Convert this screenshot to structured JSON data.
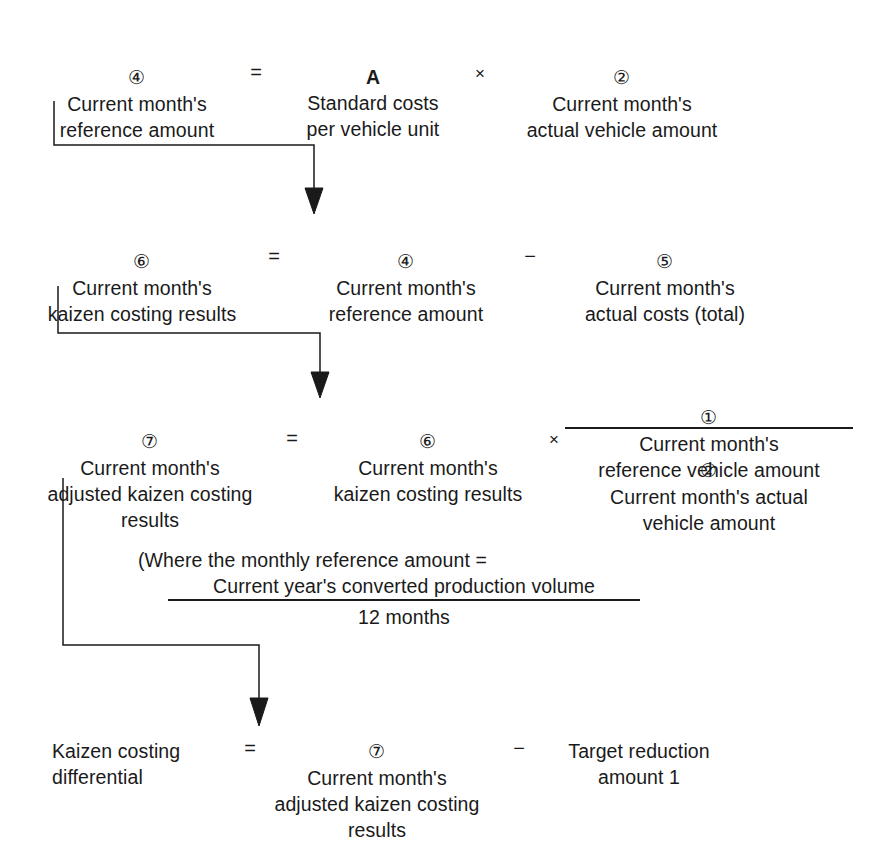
{
  "diagram": {
    "background": "#ffffff",
    "ink": "#1a1a1a",
    "rows": [
      {
        "id": "row1",
        "lhs_marker": "④",
        "lhs_text": "Current month's\nreference amount",
        "operator1": "=",
        "term1_marker": "A",
        "term1_text": "Standard costs\nper vehicle unit",
        "operator2": "×",
        "term2_marker": "②",
        "term2_text": "Current month's\nactual vehicle amount"
      },
      {
        "id": "row2",
        "lhs_marker": "⑥",
        "lhs_text": "Current month's\nkaizen costing results",
        "operator1": "=",
        "term1_marker": "④",
        "term1_text": "Current month's\nreference amount",
        "operator2": "−",
        "term2_marker": "⑤",
        "term2_text": "Current month's\nactual costs (total)"
      },
      {
        "id": "row3",
        "lhs_marker": "⑦",
        "lhs_text": "Current month's\nadjusted kaizen costing\nresults",
        "operator1": "=",
        "term1_marker": "⑥",
        "term1_text": "Current month's\nkaizen costing results",
        "operator2": "×",
        "fraction": {
          "numerator_marker": "①",
          "numerator_text": "Current month's\nreference vehicle amount",
          "denominator_marker": "②",
          "denominator_text": "Current month's actual\nvehicle amount"
        }
      },
      {
        "id": "row4",
        "lhs_marker": "",
        "lhs_text": "Kaizen costing\ndifferential",
        "operator1": "=",
        "term1_marker": "⑦",
        "term1_text": "Current month's\nadjusted kaizen costing\nresults",
        "operator2": "−",
        "term2_marker": "",
        "term2_text": "Target reduction\namount 1"
      }
    ],
    "note": {
      "line1": "(Where the monthly reference amount =",
      "numerator": "Current year's converted production volume",
      "denominator": "12 months"
    },
    "connectors": [
      {
        "id": "connector-1",
        "from": "row1-lhs",
        "to": "row2-term1"
      },
      {
        "id": "connector-2",
        "from": "row2-lhs",
        "to": "row3-term1"
      },
      {
        "id": "connector-3",
        "from": "row3-lhs",
        "to": "row4-term1"
      }
    ]
  }
}
